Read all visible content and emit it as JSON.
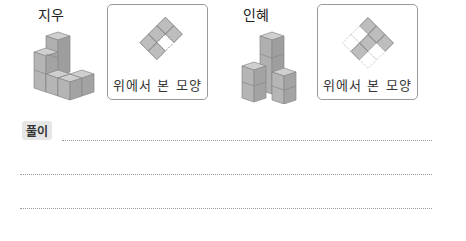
{
  "problems": [
    {
      "name": "지우",
      "caption": "위에서 본 모양",
      "top_view": {
        "grid": [
          3,
          2
        ],
        "cells": [
          [
            1,
            1
          ],
          [
            1,
            0
          ]
        ]
      }
    },
    {
      "name": "인혜",
      "caption": "위에서 본 모양"
    }
  ],
  "solution": {
    "label": "풀이"
  },
  "colors": {
    "cube_face": "#b9b9b9",
    "cell_fill": "#bdbdbd",
    "border": "#999999"
  }
}
